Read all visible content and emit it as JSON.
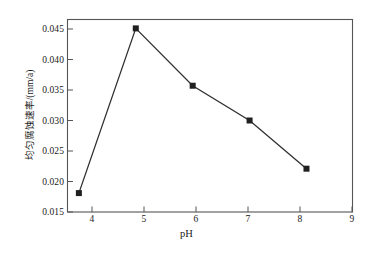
{
  "chart_data": {
    "type": "line",
    "title": "",
    "xlabel": "pH",
    "ylabel": "均匀腐蚀速率/(mm/a)",
    "x": [
      4.2,
      5.2,
      6.2,
      7.2,
      8.2
    ],
    "values": [
      0.0181,
      0.0451,
      0.0357,
      0.03,
      0.0221
    ],
    "series": [
      {
        "name": "均匀腐蚀速率",
        "values": [
          0.0181,
          0.0451,
          0.0357,
          0.03,
          0.0221
        ]
      }
    ],
    "xlim": [
      4,
      9
    ],
    "ylim": [
      0.015,
      0.0475
    ],
    "xticks": [
      4,
      5,
      6,
      7,
      8,
      9
    ],
    "xtick_labels": [
      "4",
      "5",
      "6",
      "7",
      "8",
      "9"
    ],
    "yticks": [
      0.015,
      0.02,
      0.025,
      0.03,
      0.035,
      0.04,
      0.045
    ],
    "ytick_labels": [
      "0.015",
      "0.020",
      "0.025",
      "0.030",
      "0.035",
      "0.040",
      "0.045"
    ],
    "grid": false,
    "legend": false,
    "marker": "square",
    "line_color": "#303030",
    "marker_color": "#202020",
    "axis_color": "#4a4a4a",
    "background": "#ffffff"
  },
  "axis": {
    "x_title": "pH",
    "y_title": "均匀腐蚀速率/(mm/a)"
  }
}
